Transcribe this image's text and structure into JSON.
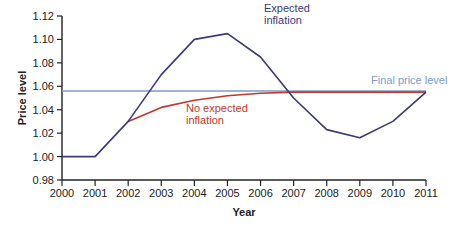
{
  "chart_data": {
    "type": "line",
    "title": "",
    "xlabel": "Year",
    "ylabel": "Price level",
    "x": [
      2000,
      2001,
      2002,
      2003,
      2004,
      2005,
      2006,
      2007,
      2008,
      2009,
      2010,
      2011
    ],
    "ylim": [
      0.98,
      1.12
    ],
    "yticks": [
      "0.98",
      "1.00",
      "1.02",
      "1.04",
      "1.06",
      "1.08",
      "1.10",
      "1.12"
    ],
    "xticks": [
      "2000",
      "2001",
      "2002",
      "2003",
      "2004",
      "2005",
      "2006",
      "2007",
      "2008",
      "2009",
      "2010",
      "2011"
    ],
    "grid": false,
    "legend": "inline annotations",
    "series": [
      {
        "name": "Expected inflation",
        "color": "#3a3a78",
        "values": [
          1.0,
          1.0,
          1.03,
          1.07,
          1.1,
          1.105,
          1.085,
          1.05,
          1.023,
          1.016,
          1.03,
          1.055
        ]
      },
      {
        "name": "No expected inflation",
        "color": "#c0392b",
        "x": [
          2002,
          2003,
          2004,
          2005,
          2006,
          2007,
          2008,
          2009,
          2010,
          2011
        ],
        "values": [
          1.03,
          1.042,
          1.048,
          1.052,
          1.054,
          1.055,
          1.055,
          1.055,
          1.055,
          1.055
        ]
      },
      {
        "name": "Final price level",
        "color": "#7d9bc8",
        "x": [
          2000,
          2011
        ],
        "values": [
          1.056,
          1.056
        ]
      }
    ],
    "annotations": [
      {
        "text_lines": [
          "Expected",
          "inflation"
        ],
        "color": "#3a3a78"
      },
      {
        "text_lines": [
          "No expected",
          "inflation"
        ],
        "color": "#c0392b"
      },
      {
        "text_lines": [
          "Final price level"
        ],
        "color": "#7d9bc8"
      }
    ]
  },
  "labels": {
    "ylabel": "Price level",
    "xlabel": "Year",
    "expected_1": "Expected",
    "expected_2": "inflation",
    "noexp_1": "No expected",
    "noexp_2": "inflation",
    "final": "Final price level"
  }
}
